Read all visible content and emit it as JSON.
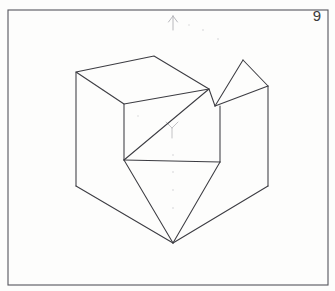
{
  "page": {
    "figure_number": "9",
    "paper_color": "#fdfdfc",
    "ink_color": "#3c3c42",
    "frame_color": "#55555c",
    "faint_mark_color": "#b9b9bd"
  },
  "frame": {
    "name": "drawing-border",
    "x": 8,
    "y": 10,
    "width": 320,
    "height": 275
  },
  "annotations": {
    "up_arrow": {
      "label": "up-direction-arrow",
      "x": 173,
      "y": 18,
      "length": 12
    },
    "y_mark": {
      "label": "faint-y-pencil-mark",
      "x": 172,
      "y": 130
    }
  },
  "chart_data": {
    "type": "line",
    "xlabel": "",
    "ylabel": "",
    "xlim": [
      0,
      335
    ],
    "ylim": [
      0,
      291
    ],
    "grid": false,
    "legend": "none",
    "vertices": {
      "cube_top_left": [
        76,
        72
      ],
      "cube_top_back": [
        154,
        56
      ],
      "cube_top_junction": [
        209,
        89
      ],
      "cube_left_mid": [
        124,
        104
      ],
      "cube_left_bottom": [
        76,
        186
      ],
      "center_junction": [
        124,
        160
      ],
      "right_junction": [
        220,
        162
      ],
      "right_upper": [
        220,
        89
      ],
      "wedge_apex": [
        243,
        60
      ],
      "wedge_inner": [
        215,
        106
      ],
      "wedge_right": [
        268,
        86
      ],
      "right_edge_bottom": [
        268,
        186
      ],
      "bottom_apex": [
        173,
        243
      ]
    },
    "series": [
      {
        "name": "cube-top-face",
        "points": [
          [
            76,
            72
          ],
          [
            154,
            56
          ],
          [
            209,
            89
          ],
          [
            124,
            104
          ],
          [
            76,
            72
          ]
        ]
      },
      {
        "name": "cube-left-vertical-edge",
        "points": [
          [
            76,
            72
          ],
          [
            76,
            186
          ]
        ]
      },
      {
        "name": "cube-front-left-vertical",
        "points": [
          [
            124,
            104
          ],
          [
            124,
            160
          ]
        ]
      },
      {
        "name": "cube-bottom-left-diagonal",
        "points": [
          [
            76,
            186
          ],
          [
            173,
            243
          ]
        ]
      },
      {
        "name": "cube-bottom-right-diagonal",
        "points": [
          [
            173,
            243
          ],
          [
            268,
            186
          ]
        ]
      },
      {
        "name": "cube-right-vertical-edge",
        "points": [
          [
            268,
            86
          ],
          [
            268,
            186
          ]
        ]
      },
      {
        "name": "notch-slant-from-top-junction",
        "points": [
          [
            209,
            89
          ],
          [
            124,
            160
          ]
        ]
      },
      {
        "name": "notch-horizontal-ledge",
        "points": [
          [
            124,
            160
          ],
          [
            220,
            162
          ]
        ]
      },
      {
        "name": "notch-right-vertical",
        "points": [
          [
            220,
            106
          ],
          [
            220,
            162
          ]
        ]
      },
      {
        "name": "wedge-left-edge",
        "points": [
          [
            215,
            106
          ],
          [
            243,
            60
          ]
        ]
      },
      {
        "name": "wedge-top-edge",
        "points": [
          [
            243,
            60
          ],
          [
            268,
            86
          ]
        ]
      },
      {
        "name": "wedge-inner-diagonal",
        "points": [
          [
            215,
            106
          ],
          [
            268,
            86
          ]
        ]
      },
      {
        "name": "wedge-base-to-right",
        "points": [
          [
            209,
            89
          ],
          [
            215,
            106
          ]
        ]
      },
      {
        "name": "bottom-vee-left",
        "points": [
          [
            124,
            160
          ],
          [
            173,
            243
          ]
        ]
      },
      {
        "name": "bottom-vee-right",
        "points": [
          [
            220,
            162
          ],
          [
            173,
            243
          ]
        ]
      }
    ]
  }
}
